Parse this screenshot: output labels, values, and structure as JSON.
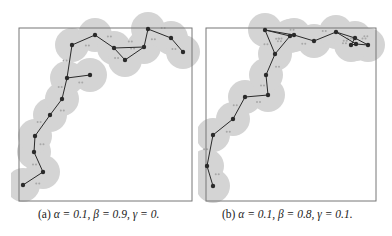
{
  "figure": {
    "panels": [
      {
        "id": "a",
        "caption_label": "(a)",
        "caption_params": "α = 0.1, β = 0.9, γ = 0.",
        "alpha": 0.1,
        "beta": 0.9,
        "gamma": 0,
        "frame": {
          "x": 19,
          "y": 28,
          "w": 173,
          "h": 173
        },
        "nodes": [
          [
            23,
            185
          ],
          [
            43,
            172
          ],
          [
            34,
            152
          ],
          [
            35,
            136
          ],
          [
            50,
            115
          ],
          [
            62,
            99
          ],
          [
            67,
            78
          ],
          [
            90,
            75
          ],
          [
            72,
            45
          ],
          [
            95,
            35
          ],
          [
            114,
            48
          ],
          [
            125,
            60
          ],
          [
            144,
            47
          ],
          [
            148,
            29
          ],
          [
            171,
            38
          ],
          [
            183,
            52
          ]
        ],
        "edges": [
          [
            0,
            1
          ],
          [
            1,
            2
          ],
          [
            2,
            3
          ],
          [
            3,
            4
          ],
          [
            4,
            5
          ],
          [
            5,
            6
          ],
          [
            6,
            7
          ],
          [
            6,
            8
          ],
          [
            8,
            9
          ],
          [
            9,
            10
          ],
          [
            10,
            11
          ],
          [
            11,
            12
          ],
          [
            12,
            13
          ],
          [
            13,
            14
          ],
          [
            14,
            15
          ],
          [
            10,
            12
          ]
        ],
        "radius": 17
      },
      {
        "id": "b",
        "caption_label": "(b)",
        "caption_params": "α = 0.1, β = 0.8, γ = 0.1.",
        "alpha": 0.1,
        "beta": 0.8,
        "gamma": 0.1,
        "frame": {
          "x": 206,
          "y": 28,
          "w": 170,
          "h": 173
        },
        "nodes": [
          [
            213,
            186
          ],
          [
            207,
            166
          ],
          [
            213,
            135
          ],
          [
            233,
            119
          ],
          [
            245,
            97
          ],
          [
            268,
            95
          ],
          [
            266,
            75
          ],
          [
            275,
            54
          ],
          [
            265,
            30
          ],
          [
            290,
            36
          ],
          [
            294,
            35
          ],
          [
            314,
            41
          ],
          [
            336,
            32
          ],
          [
            356,
            44
          ],
          [
            368,
            45
          ],
          [
            355,
            38
          ],
          [
            351,
            45
          ]
        ],
        "edges": [
          [
            0,
            1
          ],
          [
            1,
            2
          ],
          [
            2,
            3
          ],
          [
            3,
            4
          ],
          [
            4,
            5
          ],
          [
            5,
            6
          ],
          [
            6,
            7
          ],
          [
            7,
            8
          ],
          [
            8,
            9
          ],
          [
            7,
            9
          ],
          [
            8,
            10
          ],
          [
            9,
            10
          ],
          [
            10,
            11
          ],
          [
            11,
            12
          ],
          [
            12,
            15
          ],
          [
            15,
            14
          ],
          [
            12,
            13
          ],
          [
            13,
            14
          ],
          [
            15,
            16
          ],
          [
            16,
            13
          ]
        ],
        "radius": 17
      }
    ],
    "colors": {
      "halo": "#d4d4d4",
      "node": "#2a2a2a",
      "edge": "#2a2a2a",
      "frame": "#777777",
      "dot": "#a8a8a8"
    }
  }
}
